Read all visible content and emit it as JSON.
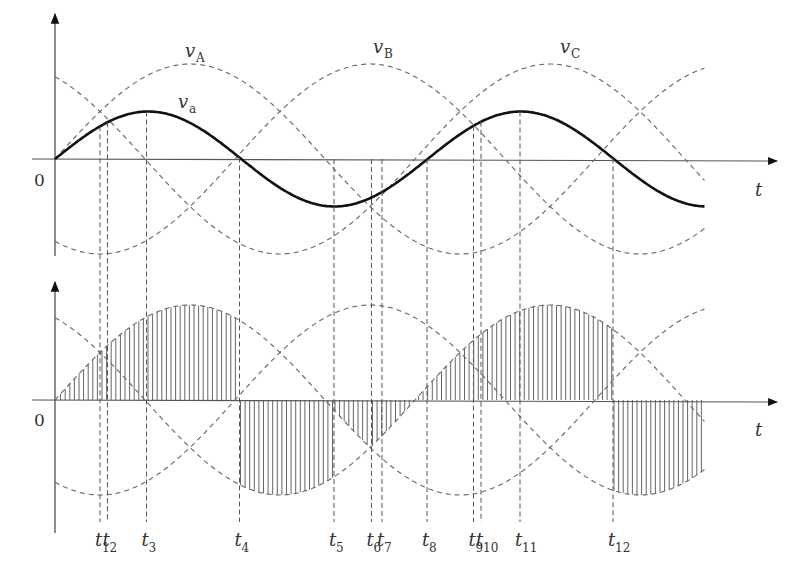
{
  "figure": {
    "panels": [
      {
        "id": "top",
        "origin_label": "0",
        "time_axis_label": "t",
        "phase_labels": [
          {
            "name": "v",
            "sub": "A"
          },
          {
            "name": "v",
            "sub": "B"
          },
          {
            "name": "v",
            "sub": "C"
          }
        ],
        "output_label": {
          "name": "v",
          "sub": "a"
        }
      },
      {
        "id": "bottom",
        "origin_label": "0",
        "time_axis_label": "t"
      }
    ],
    "time_markers": [
      {
        "name": "t",
        "sub": "1"
      },
      {
        "name": "t",
        "sub": "2"
      },
      {
        "name": "t",
        "sub": "3"
      },
      {
        "name": "t",
        "sub": "4"
      },
      {
        "name": "t",
        "sub": "5"
      },
      {
        "name": "t",
        "sub": "6"
      },
      {
        "name": "t",
        "sub": "7"
      },
      {
        "name": "t",
        "sub": "8"
      },
      {
        "name": "t",
        "sub": "9"
      },
      {
        "name": "t",
        "sub": "10"
      },
      {
        "name": "t",
        "sub": "11"
      },
      {
        "name": "t",
        "sub": "12"
      }
    ]
  },
  "chart_data": {
    "type": "line",
    "title": "",
    "xlabel": "t",
    "ylabel": "",
    "angle_unit": "degrees of input period",
    "x_range_deg": [
      0,
      433
    ],
    "phase_waveforms": [
      {
        "name": "vA",
        "amplitude": 1.0,
        "phase_deg": 0,
        "style": "dashed"
      },
      {
        "name": "vB",
        "amplitude": 1.0,
        "phase_deg": -120,
        "style": "dashed"
      },
      {
        "name": "vC",
        "amplitude": 1.0,
        "phase_deg": 120,
        "style": "dashed"
      }
    ],
    "output_waveform": {
      "name": "va",
      "amplitude": 0.5,
      "period_ratio": 0.69,
      "phase_deg": 0,
      "style": "solid"
    },
    "marker_angles_deg": [
      30,
      35,
      61,
      123,
      186,
      211,
      218,
      248,
      279,
      284,
      310,
      372
    ],
    "hatched_segments": [
      {
        "from_deg": 0,
        "to_deg": 123,
        "phase": "vA"
      },
      {
        "from_deg": 123,
        "to_deg": 186,
        "phase": "vC"
      },
      {
        "from_deg": 186,
        "to_deg": 211,
        "phase": "vA"
      },
      {
        "from_deg": 211,
        "to_deg": 372,
        "phase": "vC"
      },
      {
        "from_deg": 372,
        "to_deg": 433,
        "phase": "vB"
      }
    ]
  }
}
